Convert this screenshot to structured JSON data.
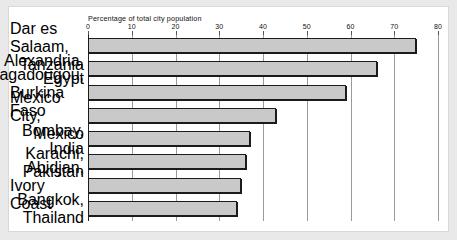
{
  "figure": {
    "axis_title": "Percentage of total city population",
    "background": "#ffffff",
    "page_margin_color": "#e9e9e9",
    "bar_fill": "#c9c9c9",
    "bar_stroke": "#1b1b1b",
    "grid_color": "#9a9a9a",
    "axis_color": "#222222"
  },
  "chart_data": {
    "type": "bar",
    "orientation": "horizontal",
    "title": "Percentage of total city population",
    "xlabel": "Percentage of total city population",
    "ylabel": "",
    "xlim": [
      0,
      80
    ],
    "grid": true,
    "legend": false,
    "xticks": [
      0,
      10,
      20,
      30,
      40,
      50,
      60,
      70,
      80
    ],
    "xtick_labels": [
      "0",
      "10",
      "20",
      "30",
      "40",
      "50",
      "60",
      "70",
      "80"
    ],
    "categories": [
      "Dar es Salaam, Tanzania",
      "Alexandria, Egypt",
      "Ouagadougou, Burkina Faso",
      "Mexico City, Mexico",
      "Bombay, India",
      "Karachi, Pakistan",
      "Abidjan, Ivory Coast",
      "Bangkok, Thailand"
    ],
    "values": [
      75,
      66,
      59,
      43,
      37,
      36,
      35,
      34
    ],
    "items": [
      {
        "city": "Dar es Salaam,",
        "country": "Tanzania",
        "value": 75
      },
      {
        "city": "Alexandria,",
        "country": "Egypt",
        "value": 66
      },
      {
        "city": "Ouagadougou,",
        "country": "Burkina Faso",
        "value": 59
      },
      {
        "city": "Mexico City,",
        "country": "Mexico",
        "value": 43
      },
      {
        "city": "Bombay,",
        "country": "India",
        "value": 37
      },
      {
        "city": "Karachi,",
        "country": "Pakistan",
        "value": 36
      },
      {
        "city": "Abidjan,",
        "country": "Ivory Coast",
        "value": 35
      },
      {
        "city": "Bangkok,",
        "country": "Thailand",
        "value": 34
      }
    ]
  }
}
